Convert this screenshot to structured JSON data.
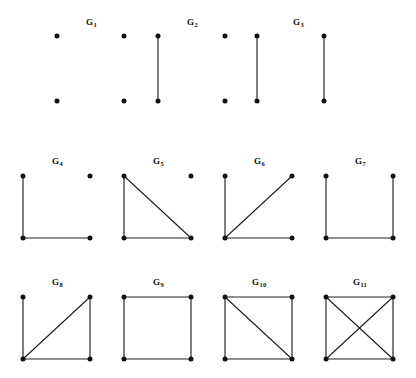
{
  "figure": {
    "title": "",
    "background_color": "#ffffff",
    "vertex_color": "#111111",
    "edge_color": "#222222",
    "label_color": "#111111",
    "width": 416,
    "height": 378
  },
  "chart_data": {
    "type": "diagram",
    "subtype": "graph-isomorphism-catalog",
    "title": "",
    "layout": {
      "rows": 3,
      "row_counts": [
        3,
        4,
        4
      ],
      "vertex_positions_normalized": {
        "top_left": [
          0,
          0
        ],
        "top_right": [
          1,
          0
        ],
        "bottom_left": [
          0,
          1
        ],
        "bottom_right": [
          1,
          1
        ]
      },
      "grid_note": "Each graph occupies a square cell; vertices sit at the four corners."
    },
    "graphs": [
      {
        "id": "G1",
        "label": "G",
        "subscript": "1",
        "row": 1,
        "col": 1,
        "box": {
          "x": 57,
          "y": 36,
          "w": 67,
          "h": 65
        },
        "label_pos": {
          "x": 86,
          "y": 18
        },
        "vertices": [
          "top_left",
          "top_right",
          "bottom_left",
          "bottom_right"
        ],
        "visible_vertices": [
          "top_left",
          "bottom_left",
          "top_right",
          "bottom_right"
        ],
        "vertex_count": 4,
        "edges": [],
        "edge_count": 0,
        "description": "Empty graph on four vertices (no edges)"
      },
      {
        "id": "G2",
        "label": "G",
        "subscript": "2",
        "row": 1,
        "col": 2,
        "box": {
          "x": 158,
          "y": 36,
          "w": 67,
          "h": 65
        },
        "label_pos": {
          "x": 187,
          "y": 18
        },
        "vertex_count": 4,
        "edges": [
          [
            "top_left",
            "bottom_left"
          ]
        ],
        "edge_count": 1,
        "description": "One edge plus two isolated vertices"
      },
      {
        "id": "G3",
        "label": "G",
        "subscript": "3",
        "row": 1,
        "col": 3,
        "box": {
          "x": 257,
          "y": 36,
          "w": 67,
          "h": 65
        },
        "label_pos": {
          "x": 293,
          "y": 18
        },
        "vertex_count": 4,
        "edges": [
          [
            "top_left",
            "bottom_left"
          ],
          [
            "top_right",
            "bottom_right"
          ]
        ],
        "edge_count": 2,
        "description": "Two disjoint edges (perfect matching)"
      },
      {
        "id": "G4",
        "label": "G",
        "subscript": "4",
        "row": 2,
        "col": 1,
        "box": {
          "x": 23,
          "y": 176,
          "w": 67,
          "h": 62
        },
        "label_pos": {
          "x": 52,
          "y": 157
        },
        "vertex_count": 4,
        "edges": [
          [
            "top_left",
            "bottom_left"
          ],
          [
            "bottom_left",
            "bottom_right"
          ]
        ],
        "edge_count": 2,
        "description": "Path on three vertices plus one isolated vertex"
      },
      {
        "id": "G5",
        "label": "G",
        "subscript": "5",
        "row": 2,
        "col": 2,
        "box": {
          "x": 124,
          "y": 176,
          "w": 67,
          "h": 62
        },
        "label_pos": {
          "x": 153,
          "y": 157
        },
        "vertex_count": 4,
        "edges": [
          [
            "top_left",
            "bottom_left"
          ],
          [
            "bottom_left",
            "bottom_right"
          ],
          [
            "top_left",
            "bottom_right"
          ]
        ],
        "edge_count": 3,
        "description": "Triangle plus one isolated vertex"
      },
      {
        "id": "G6",
        "label": "G",
        "subscript": "6",
        "row": 2,
        "col": 3,
        "box": {
          "x": 225,
          "y": 176,
          "w": 67,
          "h": 62
        },
        "label_pos": {
          "x": 254,
          "y": 157
        },
        "vertex_count": 4,
        "edges": [
          [
            "top_left",
            "bottom_left"
          ],
          [
            "bottom_left",
            "bottom_right"
          ],
          [
            "bottom_left",
            "top_right"
          ]
        ],
        "edge_count": 3,
        "description": "Star K(1,3) centred at the bottom-left vertex"
      },
      {
        "id": "G7",
        "label": "G",
        "subscript": "7",
        "row": 2,
        "col": 4,
        "box": {
          "x": 326,
          "y": 176,
          "w": 67,
          "h": 62
        },
        "label_pos": {
          "x": 355,
          "y": 157
        },
        "vertex_count": 4,
        "edges": [
          [
            "top_left",
            "bottom_left"
          ],
          [
            "bottom_left",
            "bottom_right"
          ],
          [
            "bottom_right",
            "top_right"
          ]
        ],
        "edge_count": 3,
        "description": "Path on four vertices"
      },
      {
        "id": "G8",
        "label": "G",
        "subscript": "8",
        "row": 3,
        "col": 1,
        "box": {
          "x": 23,
          "y": 297,
          "w": 67,
          "h": 62
        },
        "label_pos": {
          "x": 52,
          "y": 278
        },
        "vertex_count": 4,
        "edges": [
          [
            "top_left",
            "bottom_left"
          ],
          [
            "bottom_left",
            "bottom_right"
          ],
          [
            "bottom_right",
            "top_right"
          ],
          [
            "bottom_left",
            "top_right"
          ]
        ],
        "edge_count": 4,
        "description": "Triangle with a pendant edge (paw graph)"
      },
      {
        "id": "G9",
        "label": "G",
        "subscript": "9",
        "row": 3,
        "col": 2,
        "box": {
          "x": 124,
          "y": 297,
          "w": 67,
          "h": 62
        },
        "label_pos": {
          "x": 153,
          "y": 278
        },
        "vertex_count": 4,
        "edges": [
          [
            "top_left",
            "top_right"
          ],
          [
            "top_right",
            "bottom_right"
          ],
          [
            "bottom_right",
            "bottom_left"
          ],
          [
            "bottom_left",
            "top_left"
          ]
        ],
        "edge_count": 4,
        "description": "Four-cycle C4"
      },
      {
        "id": "G10",
        "label": "G",
        "subscript": "10",
        "row": 3,
        "col": 3,
        "box": {
          "x": 225,
          "y": 297,
          "w": 67,
          "h": 62
        },
        "label_pos": {
          "x": 252,
          "y": 278
        },
        "vertex_count": 4,
        "edges": [
          [
            "top_left",
            "top_right"
          ],
          [
            "top_right",
            "bottom_right"
          ],
          [
            "bottom_right",
            "bottom_left"
          ],
          [
            "bottom_left",
            "top_left"
          ],
          [
            "top_left",
            "bottom_right"
          ]
        ],
        "edge_count": 5,
        "description": "Four-cycle with one diagonal (diamond graph)"
      },
      {
        "id": "G11",
        "label": "G",
        "subscript": "11",
        "row": 3,
        "col": 4,
        "box": {
          "x": 326,
          "y": 297,
          "w": 67,
          "h": 62
        },
        "label_pos": {
          "x": 353,
          "y": 278
        },
        "vertex_count": 4,
        "edges": [
          [
            "top_left",
            "top_right"
          ],
          [
            "top_right",
            "bottom_right"
          ],
          [
            "bottom_right",
            "bottom_left"
          ],
          [
            "bottom_left",
            "top_left"
          ],
          [
            "top_left",
            "bottom_right"
          ],
          [
            "top_right",
            "bottom_left"
          ]
        ],
        "edge_count": 6,
        "description": "Complete graph K4"
      }
    ]
  }
}
